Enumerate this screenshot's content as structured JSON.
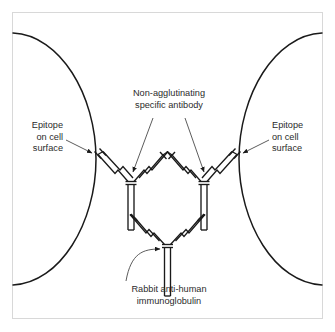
{
  "figure": {
    "type": "scientific-diagram",
    "width": 335,
    "height": 332,
    "background_color": "#ffffff",
    "frame_color": "#d8d8d8",
    "line_color": "#1a1a1a",
    "text_color": "#2b2b2b"
  },
  "labels": {
    "epitope_left": {
      "line1": "Epitope",
      "line2": "on cell",
      "line3": "surface",
      "align": "right"
    },
    "epitope_right": {
      "line1": "Epitope",
      "line2": "on cell",
      "line3": "surface",
      "align": "left"
    },
    "antibody_top": {
      "line1": "Non-agglutinating",
      "line2": "specific antibody",
      "align": "center"
    },
    "antibody_bottom": {
      "line1": "Rabbit anti-human",
      "line2": "immunoglobulin",
      "align": "center"
    }
  },
  "elements": {
    "cell_left_name": "left-cell-membrane",
    "cell_right_name": "right-cell-membrane",
    "antibody_left_name": "specific-antibody-left",
    "antibody_right_name": "specific-antibody-right",
    "antibody_bottom_name": "rabbit-anti-human-immunoglobulin",
    "leader_left_name": "leader-line-epitope-left",
    "leader_right_name": "leader-line-epitope-right",
    "leader_top_left_name": "leader-line-antibody-top-left",
    "leader_top_right_name": "leader-line-antibody-top-right",
    "leader_bottom_name": "leader-line-antibody-bottom"
  }
}
